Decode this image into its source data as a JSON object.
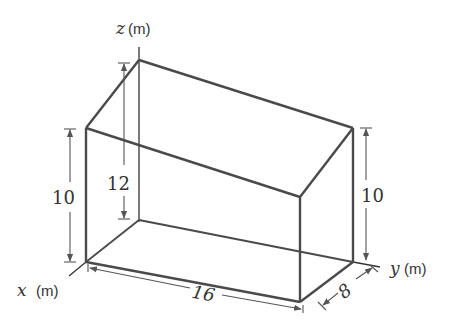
{
  "diagram": {
    "axes": {
      "x": {
        "symbol": "x",
        "unit": "(m)"
      },
      "y": {
        "symbol": "y",
        "unit": "(m)"
      },
      "z": {
        "symbol": "z",
        "unit": "(m)"
      }
    },
    "dimensions": {
      "front_height": "10",
      "back_height": "12",
      "right_height": "10",
      "length": "16",
      "width": "8"
    },
    "colors": {
      "edge": "#4a4a4a",
      "dimension": "#555555",
      "background": "#ffffff"
    }
  }
}
